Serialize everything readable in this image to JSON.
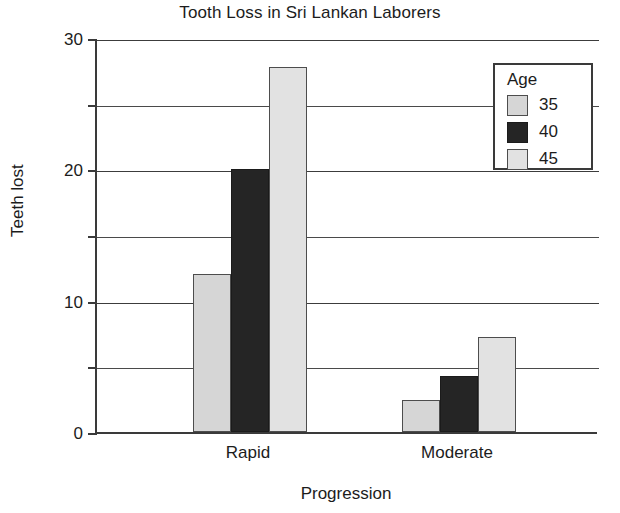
{
  "chart_data": {
    "type": "bar",
    "title": "Tooth Loss in Sri Lankan Laborers",
    "xlabel": "Progression",
    "ylabel": "Teeth lost",
    "categories": [
      "Rapid",
      "Moderate"
    ],
    "series": [
      {
        "name": "35",
        "values": [
          12,
          2.4
        ],
        "color": "#d6d6d6"
      },
      {
        "name": "40",
        "values": [
          20,
          4.3
        ],
        "color": "#252525"
      },
      {
        "name": "45",
        "values": [
          27.8,
          7.2
        ],
        "color": "#e2e2e2"
      }
    ],
    "ylim": [
      0,
      30
    ],
    "ytick_labels": [
      "0",
      "10",
      "20",
      "30"
    ],
    "ytick_values": [
      0,
      10,
      20,
      30
    ],
    "minor_gridline_values": [
      5,
      15,
      25
    ],
    "grid": true,
    "legend": {
      "title": "Age",
      "position": "inside-top-right"
    }
  }
}
